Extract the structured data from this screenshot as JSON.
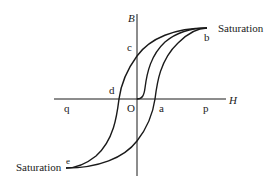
{
  "diagram": {
    "axes": {
      "vertical_label": "B",
      "horizontal_label": "H",
      "origin_label": "O"
    },
    "points": {
      "a": "a",
      "b": "b",
      "c": "c",
      "d": "d",
      "e": "e",
      "p": "p",
      "q": "q"
    },
    "annotations": {
      "saturation_top": "Saturation",
      "saturation_bottom": "Saturation"
    },
    "colors": {
      "stroke": "#1a1a1a",
      "background": "#ffffff"
    }
  }
}
